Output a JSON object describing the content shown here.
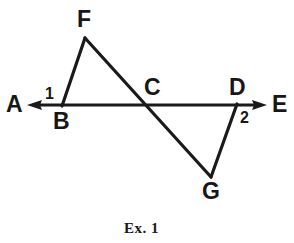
{
  "figure": {
    "caption": "Ex. 1",
    "background_color": "#ffffff",
    "stroke_color": "#1a1a1a",
    "stroke_width": 3,
    "labels": {
      "A": "A",
      "B": "B",
      "C": "C",
      "D": "D",
      "E": "E",
      "F": "F",
      "G": "G",
      "angle_1": "1",
      "angle_2": "2"
    },
    "points": {
      "A": {
        "x": 28,
        "y": 105
      },
      "B": {
        "x": 62,
        "y": 105
      },
      "C": {
        "x": 146,
        "y": 105
      },
      "D": {
        "x": 236,
        "y": 105
      },
      "E": {
        "x": 266,
        "y": 105
      },
      "F": {
        "x": 85,
        "y": 38
      },
      "G": {
        "x": 211,
        "y": 177
      }
    },
    "segments": [
      {
        "name": "line-AE",
        "from": "A",
        "to": "E",
        "arrow_start": true,
        "arrow_end": true
      },
      {
        "name": "segment-FB",
        "from": "F",
        "to": "B",
        "arrow_start": false,
        "arrow_end": false
      },
      {
        "name": "segment-FG",
        "from": "F",
        "to": "G",
        "arrow_start": false,
        "arrow_end": false
      },
      {
        "name": "segment-GD",
        "from": "G",
        "to": "D",
        "arrow_start": false,
        "arrow_end": false
      }
    ]
  }
}
